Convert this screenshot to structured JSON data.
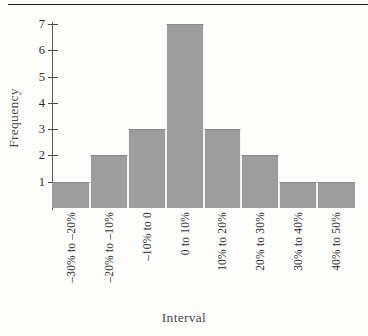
{
  "figure": {
    "caption_remnant": "",
    "background_color": "#fdfdfc",
    "rule_color": "#1a1a1a"
  },
  "chart_data": {
    "type": "bar",
    "title": "",
    "xlabel": "Interval",
    "ylabel": "Frequency",
    "categories": [
      "–30% to –20%",
      "–20% to –10%",
      "–10% to 0",
      "0 to 10%",
      "10% to 20%",
      "20% to 30%",
      "30% to 40%",
      "40% to 50%"
    ],
    "values": [
      1,
      2,
      3,
      7,
      3,
      2,
      1,
      1
    ],
    "ylim": [
      0,
      7
    ],
    "ytick_labels": [
      "1",
      "2",
      "3",
      "4",
      "5",
      "6",
      "7"
    ],
    "ytick_values": [
      1,
      2,
      3,
      4,
      5,
      6,
      7
    ],
    "grid": false,
    "legend": false,
    "bar_color": "#9d9d9d",
    "axis_color": "#4a4a4a",
    "text_color": "#2f2f2f"
  }
}
